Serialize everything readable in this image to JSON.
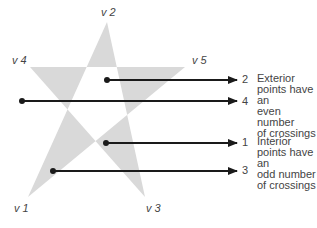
{
  "diagram": {
    "vertices": [
      {
        "id": "v1",
        "label": "v 1"
      },
      {
        "id": "v2",
        "label": "v 2"
      },
      {
        "id": "v3",
        "label": "v 3"
      },
      {
        "id": "v4",
        "label": "v 4"
      },
      {
        "id": "v5",
        "label": "v 5"
      }
    ],
    "rays": [
      {
        "crossings": "2"
      },
      {
        "crossings": "4"
      },
      {
        "crossings": "1"
      },
      {
        "crossings": "3"
      }
    ],
    "exterior_note": {
      "lines": [
        "Exterior",
        "points have an",
        "even number",
        "of crossings"
      ]
    },
    "interior_note": {
      "lines": [
        "Interior",
        "points have an",
        "odd number",
        "of crossings"
      ]
    },
    "colors": {
      "star_fill": "#d9d9d9",
      "line": "#1a1a1a",
      "text": "#444444"
    }
  }
}
